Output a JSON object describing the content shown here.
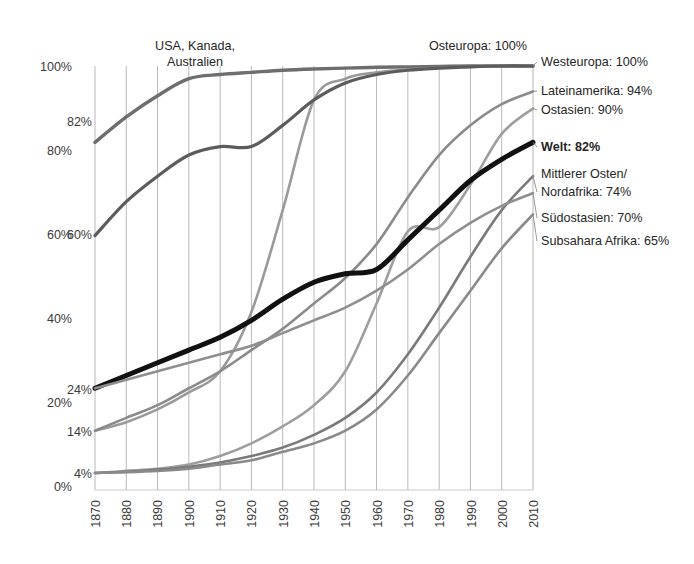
{
  "chart_data": {
    "type": "line",
    "title": "",
    "xlabel": "",
    "ylabel": "",
    "xlim": [
      1870,
      2010
    ],
    "ylim": [
      0,
      100
    ],
    "grid": "vertical",
    "legend_position": "right-inline",
    "x": [
      1870,
      1880,
      1890,
      1900,
      1910,
      1920,
      1930,
      1940,
      1950,
      1960,
      1970,
      1980,
      1990,
      2000,
      2010
    ],
    "categories": [
      "1870",
      "1880",
      "1890",
      "1900",
      "1910",
      "1920",
      "1930",
      "1940",
      "1950",
      "1960",
      "1970",
      "1980",
      "1990",
      "2000",
      "2010"
    ],
    "y_ticks": [
      "0%",
      "20%",
      "40%",
      "60%",
      "80%",
      "100%"
    ],
    "y_tick_values": [
      0,
      20,
      40,
      60,
      80,
      100
    ],
    "y_value_callouts": [
      {
        "label": "82%",
        "value": 82
      },
      {
        "label": "60%",
        "value": 60
      },
      {
        "label": "24%",
        "value": 24
      },
      {
        "label": "14%",
        "value": 14
      },
      {
        "label": "4%",
        "value": 4
      }
    ],
    "annotations": [
      {
        "text": "USA, Kanada,",
        "x": 1900,
        "y": 107
      },
      {
        "text": "Australien",
        "x": 1900,
        "y": 101
      },
      {
        "text": "Osteuropa: 100%",
        "x": 1960,
        "y": 107
      }
    ],
    "series": [
      {
        "name": "Westeuropa",
        "end_label": "Westeuropa: 100%",
        "end_value": 100,
        "color": "#6e6e6e",
        "width": 3.4,
        "values": [
          82,
          88,
          93,
          97,
          98,
          98.5,
          99,
          99.3,
          99.5,
          99.7,
          99.8,
          99.9,
          100,
          100,
          100
        ]
      },
      {
        "name": "Osteuropa",
        "end_label": "Osteuropa: 100%",
        "end_value": 100,
        "color": "#9a9a9a",
        "width": 2.6,
        "values": [
          14,
          16,
          19,
          23,
          28,
          42,
          66,
          92,
          97,
          98.5,
          99.2,
          99.6,
          99.8,
          100,
          100
        ]
      },
      {
        "name": "USA, Kanada, Australien",
        "end_label": "",
        "end_value": 100,
        "color": "#5c5c5c",
        "width": 3.2,
        "values": [
          60,
          68,
          74,
          79,
          81,
          81,
          86,
          92,
          96,
          98,
          99,
          99.5,
          99.8,
          100,
          100
        ]
      },
      {
        "name": "Lateinamerika",
        "end_label": "Lateinamerika: 94%",
        "end_value": 94,
        "color": "#8b8b8b",
        "width": 2.6,
        "values": [
          14,
          17,
          20,
          24,
          28,
          33,
          38,
          44,
          50,
          58,
          69,
          79,
          86,
          91,
          94
        ]
      },
      {
        "name": "Ostasien",
        "end_label": "Ostasien: 90%",
        "end_value": 90,
        "color": "#9e9e9e",
        "width": 2.6,
        "values": [
          4,
          4.5,
          5,
          6,
          8,
          11,
          15,
          20,
          28,
          44,
          61,
          62,
          72,
          84,
          90
        ]
      },
      {
        "name": "Welt",
        "end_label": "Welt: 82%",
        "end_value": 82,
        "color": "#111111",
        "width": 5.0,
        "values": [
          24,
          27,
          30,
          33,
          36,
          40,
          45,
          49,
          51,
          52,
          59,
          66,
          73,
          78,
          82
        ]
      },
      {
        "name": "Mittlerer Osten/Nordafrika",
        "end_label": "Mittlerer Osten/ Nordafrika: 74%",
        "end_value": 74,
        "color": "#7a7a7a",
        "width": 2.6,
        "values": [
          4,
          4.3,
          4.8,
          5.5,
          6.5,
          8,
          10,
          13,
          17,
          23,
          32,
          43,
          55,
          66,
          74
        ]
      },
      {
        "name": "Südostasien",
        "end_label": "Südostasien: 70%",
        "end_value": 70,
        "color": "#8f8f8f",
        "width": 2.6,
        "values": [
          24,
          26,
          28,
          30,
          32,
          34,
          37,
          40,
          43,
          47,
          52,
          58,
          63,
          67,
          70
        ]
      },
      {
        "name": "Subsahara Afrika",
        "end_label": "Subsahara Afrika: 65%",
        "end_value": 65,
        "color": "#8a8a8a",
        "width": 2.6,
        "values": [
          4,
          4.2,
          4.5,
          5,
          6,
          7,
          9,
          11,
          14,
          19,
          27,
          37,
          47,
          57,
          65
        ]
      }
    ]
  },
  "labels": {
    "annot_usa_line1": "USA, Kanada,",
    "annot_usa_line2": "Australien",
    "annot_osteuropa": "Osteuropa: 100%",
    "legend_westeuropa": "Westeuropa: 100%",
    "legend_lateinamerika": "Lateinamerika: 94%",
    "legend_ostasien": "Ostasien: 90%",
    "legend_welt": "Welt: 82%",
    "legend_mittlerer_osten_1": "Mittlerer Osten/",
    "legend_mittlerer_osten_2": "Nordafrika: 74%",
    "legend_suedostasien": "Südostasien: 70%",
    "legend_subsahara": "Subsahara Afrika: 65%",
    "y_100": "100%",
    "y_82": "82%",
    "y_80": "80%",
    "y_60a": "60%",
    "y_60b": "60%",
    "y_40": "40%",
    "y_24": "24%",
    "y_20": "20%",
    "y_14": "14%",
    "y_4": "4%",
    "y_0": "0%",
    "x_1870": "1870",
    "x_1880": "1880",
    "x_1890": "1890",
    "x_1900": "1900",
    "x_1910": "1910",
    "x_1920": "1920",
    "x_1930": "1930",
    "x_1940": "1940",
    "x_1950": "1950",
    "x_1960": "1960",
    "x_1970": "1970",
    "x_1980": "1980",
    "x_1990": "1990",
    "x_2000": "2000",
    "x_2010": "2010"
  }
}
